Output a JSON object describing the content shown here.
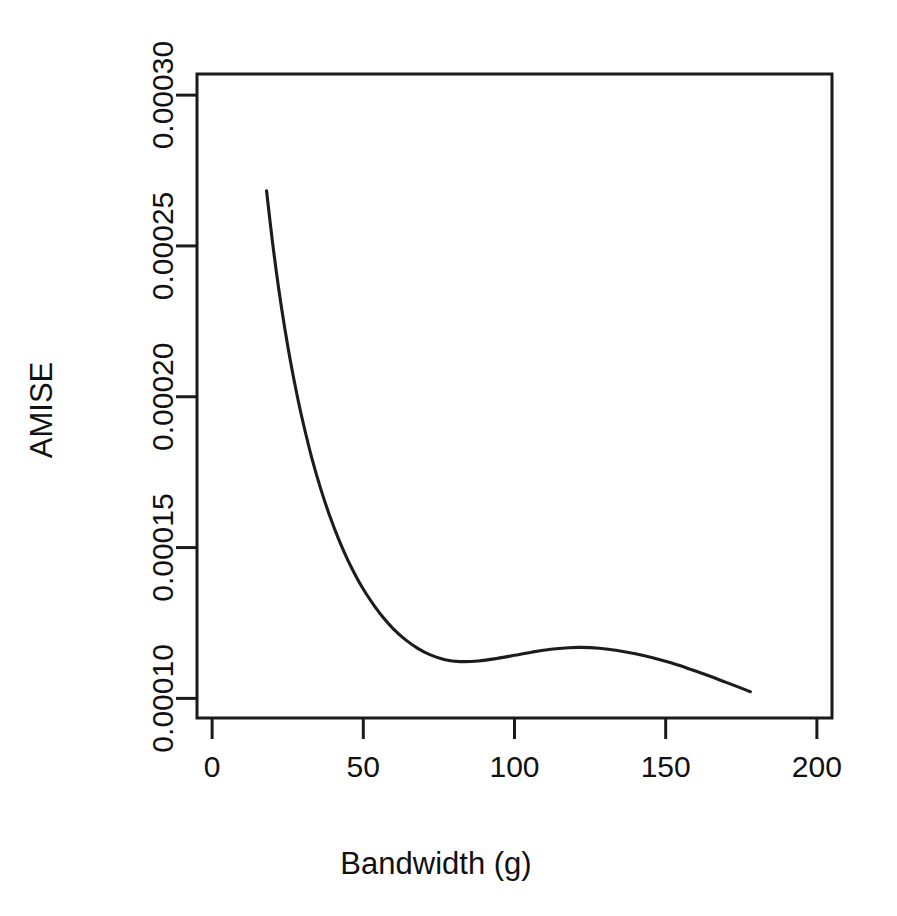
{
  "chart_data": {
    "type": "line",
    "title": "",
    "subtitle": "",
    "xlabel": "Bandwidth (g)",
    "ylabel": "AMISE",
    "xlim": [
      -5,
      205
    ],
    "ylim": [
      9.35e-05,
      0.000307
    ],
    "xticks": [
      0,
      50,
      100,
      150,
      200
    ],
    "xticklabels": [
      "0",
      "50",
      "100",
      "150",
      "200"
    ],
    "yticks": [
      0.0001,
      0.00015,
      0.0002,
      0.00025,
      0.0003
    ],
    "yticklabels": [
      "0.00010",
      "0.00015",
      "0.00020",
      "0.00025",
      "0.00030"
    ],
    "grid": false,
    "legend": false,
    "legend_position": "none",
    "annotations": [],
    "series": [
      {
        "name": "AMISE(g)",
        "color": "#1c1c1c",
        "x": [
          18,
          20,
          22,
          24,
          26,
          28,
          30,
          33,
          36,
          39,
          42,
          45,
          48,
          51,
          54,
          57,
          60,
          64,
          68,
          72,
          77,
          82,
          88,
          94,
          100,
          106,
          112,
          118,
          122,
          128,
          134,
          140,
          146,
          152,
          158,
          164,
          170,
          175,
          178
        ],
        "y": [
          0.0002683,
          0.000251,
          0.000236,
          0.0002229,
          0.0002113,
          0.000201,
          0.0001918,
          0.0001796,
          0.0001692,
          0.0001602,
          0.0001524,
          0.0001456,
          0.0001397,
          0.0001346,
          0.0001302,
          0.0001263,
          0.000123,
          0.0001194,
          0.0001166,
          0.0001145,
          0.0001128,
          0.0001122,
          0.0001124,
          0.0001132,
          0.0001143,
          0.0001154,
          0.0001163,
          0.0001168,
          0.0001169,
          0.0001166,
          0.0001159,
          0.0001148,
          0.0001134,
          0.0001117,
          0.0001097,
          0.0001076,
          0.0001053,
          0.0001034,
          0.0001022
        ]
      }
    ]
  },
  "axes": {
    "y_title": "AMISE",
    "x_title": "Bandwidth (g)"
  }
}
